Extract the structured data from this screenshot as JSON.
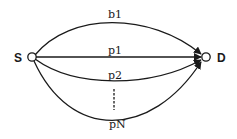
{
  "diagram": {
    "type": "multipath-graph",
    "nodes": [
      {
        "id": "S",
        "label": "S"
      },
      {
        "id": "D",
        "label": "D"
      }
    ],
    "edges": [
      {
        "id": "b1",
        "label": "b1",
        "from": "S",
        "to": "D",
        "shape": "arc-up"
      },
      {
        "id": "p1",
        "label": "p1",
        "from": "S",
        "to": "D",
        "shape": "straight"
      },
      {
        "id": "p2",
        "label": "p2",
        "from": "S",
        "to": "D",
        "shape": "arc-down"
      },
      {
        "id": "pN",
        "label": "pN",
        "from": "S",
        "to": "D",
        "shape": "arc-down-deep"
      }
    ],
    "ellipsis": "vertical-dashed"
  },
  "colors": {
    "stroke": "#1a1a1a",
    "background": "#ffffff"
  }
}
